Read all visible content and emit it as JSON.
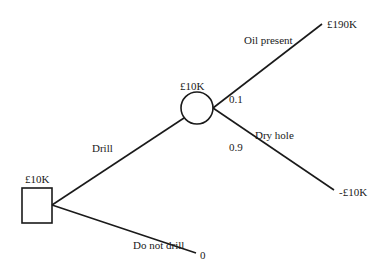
{
  "diagram": {
    "type": "decision-tree",
    "nodes": {
      "decision": {
        "shape": "square",
        "value": "£10K"
      },
      "chance": {
        "shape": "circle",
        "value": "£10K"
      }
    },
    "branches": {
      "drill": {
        "label": "Drill"
      },
      "do_not_drill": {
        "label": "Do not drill",
        "payoff": "0"
      },
      "oil_present": {
        "label": "Oil present",
        "probability": "0.1",
        "payoff": "£190K"
      },
      "dry_hole": {
        "label": "Dry hole",
        "probability": "0.9",
        "payoff": "-£10K"
      }
    },
    "colors": {
      "line": "#1a1a1a",
      "background": "#ffffff"
    }
  }
}
